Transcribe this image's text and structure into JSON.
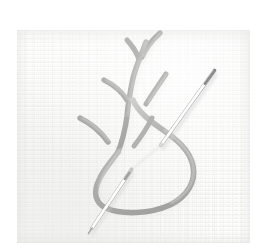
{
  "image": {
    "kind": "photograph",
    "subject": "hand embroidery in progress",
    "alt_text": "Close-up photograph of pale woven linen fabric with light gray embroidered feather-stitch branches and a large looped thread, with a steel sewing needle passing diagonally through the cloth.",
    "caption": "",
    "visible_text": ""
  },
  "colors": {
    "paper_white": "#ffffff",
    "fabric_base": "#f6f6f5",
    "fabric_highlight": "#ffffff",
    "fabric_shadow": "#e2e2e0",
    "thread_light": "#c9c9c7",
    "thread_mid": "#b2b2b0",
    "thread_dark": "#9d9d9b",
    "needle_body": "#d8d8d8",
    "needle_highlight": "#ffffff",
    "needle_shadow": "#8e8e8e",
    "cast_shadow": "#dedede"
  },
  "fabric": {
    "label": "linen ground fabric",
    "left": 17,
    "top": 30,
    "width": 233,
    "height": 213,
    "weave_pitch_px": 4
  },
  "embroidery": {
    "label": "feather stitch motif",
    "thread_width_px": 5.5,
    "elements": [
      {
        "name": "loop-teardrop",
        "label": "large thread loop",
        "description": "big teardrop-shaped loop of slack thread in the lower half"
      },
      {
        "name": "stem-main",
        "label": "main stem line",
        "description": "vertical stem running from top of motif down into the loop"
      },
      {
        "name": "branch-upper-left",
        "label": "upper left branch"
      },
      {
        "name": "branch-upper-right",
        "label": "upper right branch"
      },
      {
        "name": "branch-mid-left",
        "label": "middle left branch"
      },
      {
        "name": "branch-mid-right",
        "label": "middle right branch"
      },
      {
        "name": "branch-lower-left",
        "label": "lower left branch"
      },
      {
        "name": "branch-lower-right",
        "label": "lower right branch"
      }
    ]
  },
  "needle": {
    "label": "steel sewing needle",
    "angle_degrees": -42,
    "segments": [
      {
        "name": "needle-upper-segment",
        "label": "eye end above cloth",
        "x1": 214,
        "y1": 71,
        "x2": 161,
        "y2": 145
      },
      {
        "name": "needle-lower-segment",
        "label": "point end below cloth",
        "x1": 131,
        "y1": 170,
        "x2": 88,
        "y2": 234
      }
    ],
    "tip": {
      "x": 88,
      "y": 234
    },
    "eye_end": {
      "x": 214,
      "y": 71
    }
  }
}
